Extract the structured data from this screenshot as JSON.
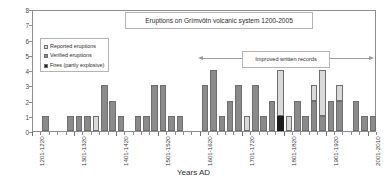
{
  "chart_data": {
    "type": "bar",
    "title": "Eruptions on Grímvötn volcanic system 1200-2005",
    "xlabel": "Years AD",
    "ylabel": "Number of eruptions",
    "ylim": [
      0,
      8
    ],
    "yticks": [
      0,
      1,
      2,
      3,
      4,
      5,
      6,
      7,
      8
    ],
    "grid": false,
    "legend_position": "inside-upper-left",
    "stacked": true,
    "series": [
      {
        "name": "Reported eruptions",
        "color": "#d9d9d9"
      },
      {
        "name": "Verified eruptions",
        "color": "#8a8a8a"
      },
      {
        "name": "Fires (partly explosive)",
        "color": "#1c1c1c"
      }
    ],
    "annotations": [
      {
        "text": "Improved written records",
        "type": "double-arrow",
        "from": "1601",
        "to": "2010"
      }
    ],
    "xtick_labels": [
      "1201-1220",
      "1301-1320",
      "1401-1420",
      "1501-1520",
      "1601-1620",
      "1701-1720",
      "1801-1820",
      "1901-1920",
      "2001-2010"
    ],
    "bin_width_years": 20,
    "bins": [
      {
        "period": "1201-1220",
        "verified": 0,
        "reported": 0,
        "fires": 0
      },
      {
        "period": "1221-1240",
        "verified": 1,
        "reported": 0,
        "fires": 0
      },
      {
        "period": "1241-1260",
        "verified": 0,
        "reported": 0,
        "fires": 0
      },
      {
        "period": "1261-1280",
        "verified": 0,
        "reported": 0,
        "fires": 0
      },
      {
        "period": "1281-1300",
        "verified": 1,
        "reported": 0,
        "fires": 0
      },
      {
        "period": "1301-1320",
        "verified": 1,
        "reported": 0,
        "fires": 0
      },
      {
        "period": "1321-1340",
        "verified": 1,
        "reported": 0,
        "fires": 0
      },
      {
        "period": "1341-1360",
        "verified": 0,
        "reported": 1,
        "fires": 0
      },
      {
        "period": "1361-1380",
        "verified": 3,
        "reported": 0,
        "fires": 0
      },
      {
        "period": "1381-1400",
        "verified": 2,
        "reported": 0,
        "fires": 0
      },
      {
        "period": "1401-1420",
        "verified": 1,
        "reported": 0,
        "fires": 0
      },
      {
        "period": "1421-1440",
        "verified": 0,
        "reported": 0,
        "fires": 0
      },
      {
        "period": "1441-1460",
        "verified": 1,
        "reported": 0,
        "fires": 0
      },
      {
        "period": "1461-1480",
        "verified": 1,
        "reported": 0,
        "fires": 0
      },
      {
        "period": "1481-1500",
        "verified": 3,
        "reported": 0,
        "fires": 0
      },
      {
        "period": "1501-1520",
        "verified": 3,
        "reported": 0,
        "fires": 0
      },
      {
        "period": "1521-1540",
        "verified": 1,
        "reported": 0,
        "fires": 0
      },
      {
        "period": "1541-1560",
        "verified": 1,
        "reported": 0,
        "fires": 0
      },
      {
        "period": "1561-1580",
        "verified": 0,
        "reported": 0,
        "fires": 0
      },
      {
        "period": "1581-1600",
        "verified": 0,
        "reported": 0,
        "fires": 0
      },
      {
        "period": "1601-1620",
        "verified": 3,
        "reported": 0,
        "fires": 0
      },
      {
        "period": "1621-1640",
        "verified": 4,
        "reported": 0,
        "fires": 0
      },
      {
        "period": "1641-1660",
        "verified": 1,
        "reported": 0,
        "fires": 0
      },
      {
        "period": "1661-1680",
        "verified": 2,
        "reported": 0,
        "fires": 0
      },
      {
        "period": "1681-1700",
        "verified": 3,
        "reported": 0,
        "fires": 0
      },
      {
        "period": "1701-1720",
        "verified": 0,
        "reported": 1,
        "fires": 0
      },
      {
        "period": "1721-1740",
        "verified": 3,
        "reported": 0,
        "fires": 0
      },
      {
        "period": "1741-1760",
        "verified": 1,
        "reported": 0,
        "fires": 0
      },
      {
        "period": "1761-1780",
        "verified": 2,
        "reported": 0,
        "fires": 0
      },
      {
        "period": "1781-1800",
        "verified": 0,
        "reported": 3,
        "fires": 1
      },
      {
        "period": "1801-1820",
        "verified": 0,
        "reported": 1,
        "fires": 0
      },
      {
        "period": "1821-1840",
        "verified": 2,
        "reported": 0,
        "fires": 0
      },
      {
        "period": "1841-1860",
        "verified": 1,
        "reported": 0,
        "fires": 0
      },
      {
        "period": "1861-1880",
        "verified": 2,
        "reported": 1,
        "fires": 0
      },
      {
        "period": "1881-1900",
        "verified": 1,
        "reported": 3,
        "fires": 0
      },
      {
        "period": "1901-1920",
        "verified": 2,
        "reported": 0,
        "fires": 0
      },
      {
        "period": "1921-1940",
        "verified": 2,
        "reported": 1,
        "fires": 0
      },
      {
        "period": "1941-1960",
        "verified": 0,
        "reported": 0,
        "fires": 0
      },
      {
        "period": "1961-1980",
        "verified": 2,
        "reported": 0,
        "fires": 0
      },
      {
        "period": "1981-2000",
        "verified": 1,
        "reported": 0,
        "fires": 0
      },
      {
        "period": "2001-2010",
        "verified": 1,
        "reported": 0,
        "fires": 0
      }
    ]
  }
}
